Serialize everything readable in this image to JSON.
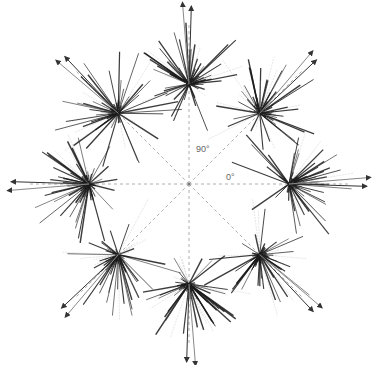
{
  "diagram": {
    "type": "radial direction-tuning plot",
    "directions": [
      0,
      45,
      90,
      135,
      180,
      225,
      270,
      315
    ],
    "labels": {
      "angle_90": "90°",
      "angle_0": "0°"
    },
    "colors": {
      "lines": "#1a1a1a",
      "guides": "#9a9a9a",
      "faint": "#aaaaaa"
    }
  }
}
